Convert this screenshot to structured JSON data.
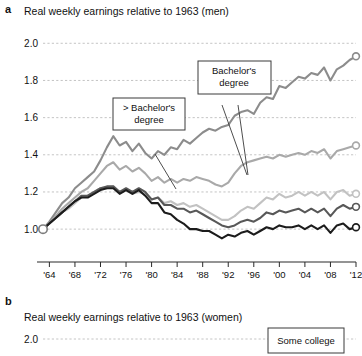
{
  "figure": {
    "panel_a": {
      "letter": "a",
      "title": "Real weekly earnings relative to 1963 (men)"
    },
    "panel_b": {
      "letter": "b",
      "title": "Real weekly earnings relative to 1963 (women)"
    }
  },
  "annotations": {
    "gt_bachelors": "> Bachelor's\ndegree",
    "gt_bachelors_line1": "> Bachelor's",
    "gt_bachelors_line2": "degree",
    "bachelors_line1": "Bachelor's",
    "bachelors_line2": "degree",
    "some_college": "Some college"
  },
  "colors": {
    "greater_than_bachelors": "#8c8c8c",
    "bachelors": "#a9a9a9",
    "some_college": "#c2c2c2",
    "high_school": "#585858",
    "less_than_high_school": "#1c1c1c",
    "gridline": "#b5b5b5",
    "axis": "#2a2a2a",
    "background": "#ffffff"
  },
  "chart_data": {
    "type": "line",
    "title": "Real weekly earnings relative to 1963 (men)",
    "xlabel": "Year",
    "ylabel": "",
    "xlim": [
      1963,
      2012
    ],
    "ylim": [
      0.92,
      2.05
    ],
    "yticks": [
      "1.0",
      "1.2",
      "1.4",
      "1.6",
      "1.8",
      "2.0"
    ],
    "ytick_values": [
      1.0,
      1.2,
      1.4,
      1.6,
      1.8,
      2.0
    ],
    "xticks": [
      "'64",
      "'68",
      "'72",
      "'76",
      "'80",
      "'84",
      "'88",
      "'92",
      "'96",
      "'00",
      "'04",
      "'08",
      "'12"
    ],
    "xtick_values": [
      1964,
      1968,
      1972,
      1976,
      1980,
      1984,
      1988,
      1992,
      1996,
      2000,
      2004,
      2008,
      2012
    ],
    "grid": true,
    "legend": "annotated callouts",
    "x": [
      1963,
      1964,
      1965,
      1966,
      1967,
      1968,
      1969,
      1970,
      1971,
      1972,
      1973,
      1974,
      1975,
      1976,
      1977,
      1978,
      1979,
      1980,
      1981,
      1982,
      1983,
      1984,
      1985,
      1986,
      1987,
      1988,
      1989,
      1990,
      1991,
      1992,
      1993,
      1994,
      1995,
      1996,
      1997,
      1998,
      1999,
      2000,
      2001,
      2002,
      2003,
      2004,
      2005,
      2006,
      2007,
      2008,
      2009,
      2010,
      2011,
      2012
    ],
    "series": [
      {
        "name": "> Bachelor's degree",
        "color": "#8c8c8c",
        "values": [
          1.0,
          1.04,
          1.09,
          1.14,
          1.17,
          1.22,
          1.25,
          1.28,
          1.31,
          1.37,
          1.44,
          1.5,
          1.45,
          1.47,
          1.42,
          1.46,
          1.41,
          1.38,
          1.42,
          1.4,
          1.44,
          1.43,
          1.48,
          1.46,
          1.49,
          1.52,
          1.54,
          1.53,
          1.55,
          1.56,
          1.61,
          1.63,
          1.64,
          1.62,
          1.68,
          1.71,
          1.7,
          1.77,
          1.76,
          1.79,
          1.82,
          1.81,
          1.84,
          1.83,
          1.87,
          1.8,
          1.86,
          1.88,
          1.91,
          1.93
        ]
      },
      {
        "name": "Bachelor's degree",
        "color": "#a9a9a9",
        "values": [
          1.0,
          1.03,
          1.07,
          1.11,
          1.14,
          1.17,
          1.2,
          1.22,
          1.26,
          1.3,
          1.34,
          1.36,
          1.32,
          1.34,
          1.31,
          1.33,
          1.3,
          1.26,
          1.28,
          1.25,
          1.27,
          1.25,
          1.27,
          1.26,
          1.28,
          1.27,
          1.26,
          1.24,
          1.23,
          1.25,
          1.3,
          1.34,
          1.36,
          1.37,
          1.38,
          1.39,
          1.38,
          1.4,
          1.39,
          1.4,
          1.41,
          1.4,
          1.42,
          1.41,
          1.43,
          1.38,
          1.42,
          1.43,
          1.44,
          1.45
        ]
      },
      {
        "name": "Some college",
        "color": "#c2c2c2",
        "values": [
          1.0,
          1.03,
          1.06,
          1.09,
          1.11,
          1.14,
          1.17,
          1.18,
          1.2,
          1.22,
          1.22,
          1.23,
          1.2,
          1.21,
          1.19,
          1.2,
          1.19,
          1.16,
          1.17,
          1.14,
          1.15,
          1.13,
          1.14,
          1.12,
          1.13,
          1.11,
          1.09,
          1.07,
          1.05,
          1.05,
          1.07,
          1.1,
          1.12,
          1.11,
          1.14,
          1.17,
          1.16,
          1.19,
          1.17,
          1.18,
          1.2,
          1.18,
          1.2,
          1.18,
          1.2,
          1.16,
          1.2,
          1.21,
          1.18,
          1.19
        ]
      },
      {
        "name": "High school",
        "color": "#585858",
        "values": [
          1.0,
          1.03,
          1.06,
          1.09,
          1.12,
          1.15,
          1.18,
          1.18,
          1.2,
          1.22,
          1.23,
          1.23,
          1.2,
          1.22,
          1.2,
          1.22,
          1.2,
          1.16,
          1.17,
          1.13,
          1.13,
          1.11,
          1.11,
          1.09,
          1.1,
          1.08,
          1.06,
          1.04,
          1.02,
          1.01,
          1.02,
          1.04,
          1.05,
          1.04,
          1.06,
          1.09,
          1.08,
          1.1,
          1.09,
          1.1,
          1.11,
          1.09,
          1.11,
          1.09,
          1.11,
          1.07,
          1.11,
          1.13,
          1.11,
          1.12
        ]
      },
      {
        "name": "< High school",
        "color": "#1c1c1c",
        "values": [
          1.0,
          1.03,
          1.06,
          1.09,
          1.12,
          1.15,
          1.17,
          1.17,
          1.19,
          1.21,
          1.22,
          1.22,
          1.19,
          1.21,
          1.19,
          1.21,
          1.18,
          1.14,
          1.14,
          1.09,
          1.08,
          1.05,
          1.03,
          1.0,
          1.0,
          0.99,
          0.99,
          0.97,
          0.95,
          0.97,
          0.96,
          0.98,
          0.99,
          0.97,
          0.99,
          1.01,
          1.0,
          1.02,
          1.01,
          1.01,
          1.02,
          1.0,
          1.02,
          1.0,
          1.02,
          0.98,
          1.02,
          1.03,
          1.0,
          1.01
        ]
      }
    ]
  },
  "chart_data_b": {
    "type": "line",
    "title": "Real weekly earnings relative to 1963 (women)",
    "yticks": [
      "2.0"
    ],
    "grid": true
  }
}
